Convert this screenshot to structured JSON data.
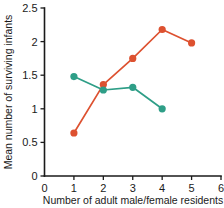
{
  "chart_data": {
    "type": "line",
    "title": "",
    "xlabel": "Number of adult male/female residents",
    "ylabel": "Mean number of surviving infants",
    "xlim": [
      0,
      6
    ],
    "ylim": [
      0,
      2.5
    ],
    "xticks": [
      0,
      1,
      2,
      3,
      4,
      5,
      6
    ],
    "xticklabels": [
      "0",
      "1",
      "2",
      "3",
      "4",
      "5",
      "6"
    ],
    "yticks": [
      0,
      0.5,
      1,
      1.5,
      2,
      2.5
    ],
    "yticklabels": [
      "0",
      "0.5",
      "1",
      "1.5",
      "2",
      "2.5"
    ],
    "grid": false,
    "legend": "none",
    "series": [
      {
        "name": "orange-series",
        "color": "#dd5130",
        "marker": "circle",
        "x": [
          1,
          2,
          3,
          4,
          5
        ],
        "values": [
          0.64,
          1.36,
          1.75,
          2.18,
          1.98
        ]
      },
      {
        "name": "teal-series",
        "color": "#2e9e87",
        "marker": "circle",
        "x": [
          1,
          2,
          3,
          4
        ],
        "values": [
          1.48,
          1.28,
          1.32,
          1.0
        ]
      }
    ]
  },
  "axes": {
    "x_title": "Number of adult male/female residents",
    "y_title": "Mean number of surviving infants"
  }
}
